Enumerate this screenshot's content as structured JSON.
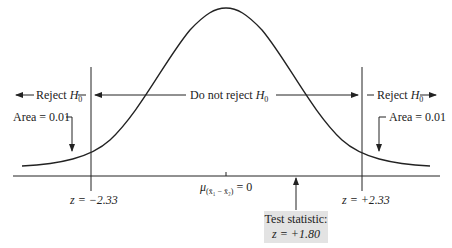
{
  "diagram": {
    "type": "normal-distribution-hypothesis-test",
    "regions": {
      "left_reject": {
        "label": "Reject",
        "symbol": "H",
        "subscript": "0"
      },
      "middle": {
        "label": "Do not reject",
        "symbol": "H",
        "subscript": "0"
      },
      "right_reject": {
        "label": "Reject",
        "symbol": "H",
        "subscript": "0"
      }
    },
    "areas": {
      "left": "Area = 0.01",
      "right": "Area = 0.01"
    },
    "critical_values": {
      "left": "z = −2.33",
      "right": "z = +2.33"
    },
    "center_label": {
      "mu": "μ",
      "subscript": "(x̄₁ − x̄₂)",
      "value": "= 0"
    },
    "test_statistic": {
      "line1": "Test statistic:",
      "line2": "z = +1.80"
    },
    "colors": {
      "line": "#222222",
      "box": "#e3e3e3"
    }
  }
}
